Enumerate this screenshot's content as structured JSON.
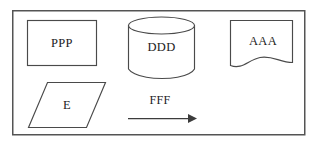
{
  "diagram": {
    "background_color": "#ffffff",
    "stroke_color": "#4a4a4a",
    "frame_color": "#545454",
    "text_color": "#1c1c1c",
    "frame": {
      "name": "outer-border",
      "x": 12,
      "y": 10,
      "width": 293,
      "height": 125
    },
    "nodes": [
      {
        "id": "process",
        "shape": "rectangle",
        "label": "PPP",
        "x": 27,
        "y": 20,
        "width": 70,
        "height": 46,
        "label_x": 62,
        "label_y": 44
      },
      {
        "id": "database",
        "shape": "cylinder",
        "label": "DDD",
        "x": 128,
        "y": 17,
        "width": 67,
        "height": 62,
        "label_x": 161,
        "label_y": 48
      },
      {
        "id": "document",
        "shape": "document",
        "label": "AAA",
        "x": 230,
        "y": 20,
        "width": 62,
        "height": 50,
        "label_x": 263,
        "label_y": 42
      },
      {
        "id": "input-output",
        "shape": "parallelogram",
        "label": "E",
        "x": 27,
        "y": 82,
        "width": 78,
        "height": 46,
        "label_x": 67,
        "label_y": 107
      }
    ],
    "connectors": [
      {
        "id": "flow-arrow",
        "shape": "arrow",
        "label": "FFF",
        "x1": 128,
        "y1": 118,
        "x2": 196,
        "y2": 118,
        "label_x": 160,
        "label_y": 102,
        "direction": "right"
      }
    ]
  }
}
